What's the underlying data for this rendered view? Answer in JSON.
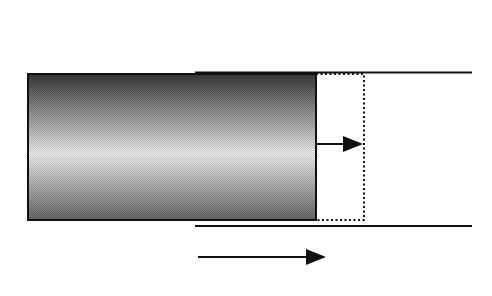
{
  "diagram": {
    "labels": {
      "current": "I",
      "displacement": "Δ x",
      "position": "x"
    },
    "coil": {
      "turns_top": 18,
      "turns_bottom": 18,
      "top_symbol": "current out of page (dot)",
      "bottom_symbol": "current into page (cross)"
    },
    "colors": {
      "ink": "#111111",
      "core_dark": "#3a3a3a",
      "core_light": "#f4f4f4"
    }
  }
}
